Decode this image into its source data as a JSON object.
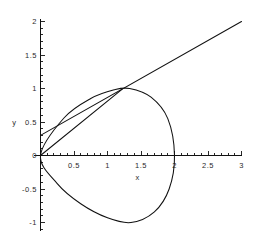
{
  "chart_data": {
    "type": "line",
    "title": "",
    "xlabel": "x",
    "ylabel": "y",
    "xlim": [
      -0.1,
      3.0
    ],
    "ylim": [
      -1.12,
      2.05
    ],
    "grid": false,
    "legend": "none",
    "x_ticks": [
      {
        "value": 0.5,
        "label": "0.5"
      },
      {
        "value": 1,
        "label": "1"
      },
      {
        "value": 1.5,
        "label": "1.5"
      },
      {
        "value": 2,
        "label": "2"
      },
      {
        "value": 2.5,
        "label": "2.5"
      },
      {
        "value": 3,
        "label": "3"
      }
    ],
    "y_ticks": [
      {
        "value": 2,
        "label": "2"
      },
      {
        "value": 1.5,
        "label": "1.5"
      },
      {
        "value": 1,
        "label": "1"
      },
      {
        "value": 0.5,
        "label": "0.5"
      },
      {
        "value": 0,
        "label": "0"
      },
      {
        "value": -0.5,
        "label": "-0.5"
      },
      {
        "value": -1,
        "label": "-1"
      }
    ],
    "x_minor_tick_step": 0.1,
    "y_minor_tick_step": 0.1,
    "series": [
      {
        "name": "closed-loop-curve",
        "type": "parametric-closed-loop",
        "description": "Closed loop starting and ending at the origin, upper branch rises to a maximum near (1.33, 1.0), rightmost extent touches the x-axis at (2, 0), lower branch dips to a minimum near (1.35, -1.0) and returns to the origin.",
        "key_points": [
          {
            "x": 0,
            "y": 0
          },
          {
            "x": 0.35,
            "y": 0.56
          },
          {
            "x": 0.75,
            "y": 0.85
          },
          {
            "x": 1.1,
            "y": 0.98
          },
          {
            "x": 1.33,
            "y": 1.0
          },
          {
            "x": 1.65,
            "y": 0.87
          },
          {
            "x": 1.9,
            "y": 0.55
          },
          {
            "x": 2.0,
            "y": 0.0
          },
          {
            "x": 1.92,
            "y": -0.5
          },
          {
            "x": 1.7,
            "y": -0.84
          },
          {
            "x": 1.35,
            "y": -1.0
          },
          {
            "x": 1.0,
            "y": -0.93
          },
          {
            "x": 0.6,
            "y": -0.72
          },
          {
            "x": 0.25,
            "y": -0.42
          },
          {
            "x": 0,
            "y": 0
          }
        ]
      },
      {
        "name": "tangent-line",
        "type": "straight-line",
        "description": "Straight line tangent to the upper branch of the loop, crossing the y-axis near y = 0.30 and exiting the plot at the top right near (3, 2).",
        "endpoints": [
          {
            "x": 0.0,
            "y": 0.3
          },
          {
            "x": 3.0,
            "y": 2.0
          }
        ],
        "slope": 0.567,
        "intercept": 0.3
      },
      {
        "name": "secant-line-through-origin",
        "type": "straight-line",
        "description": "Straight line from the origin rising to meet the tangent line near (1.2, 0.98) on the upper branch of the loop.",
        "endpoints": [
          {
            "x": 0.0,
            "y": 0.0
          },
          {
            "x": 1.22,
            "y": 0.99
          }
        ],
        "slope": 0.81,
        "intercept": 0.0
      }
    ],
    "colors": {
      "curve": "#111111",
      "axis": "#111111",
      "text": "#2b2b2b",
      "background": "#ffffff"
    }
  },
  "axes": {
    "x_axis_name": "x-axis",
    "y_axis_name": "y-axis"
  }
}
